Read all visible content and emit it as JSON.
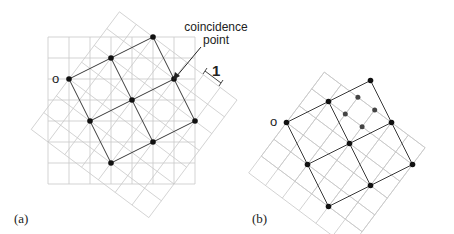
{
  "panels": [
    {
      "id": "a",
      "label": "(a)",
      "origin_label": "o",
      "annotation": {
        "line1": "coincidence",
        "line2": "point"
      },
      "scale_label": "1"
    },
    {
      "id": "b",
      "label": "(b)",
      "origin_label": "o"
    }
  ],
  "colors": {
    "grid": "#c8c8c8",
    "lattice": "#3a3a3a",
    "dot": "#111111",
    "inner_dot": "#444444"
  }
}
